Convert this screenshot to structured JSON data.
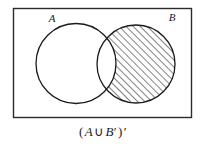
{
  "figure": {
    "universe": {
      "shape": "rectangle",
      "label": "",
      "stroke_color": "#2b2b2b"
    },
    "sets": [
      {
        "id": "A",
        "label": "A",
        "fill": "none",
        "shaded": false,
        "stroke_color": "#1a1a1a"
      },
      {
        "id": "B",
        "label": "B",
        "fill": "hatch",
        "shaded": true,
        "stroke_color": "#1a1a1a"
      }
    ],
    "shaded_region_description": "B minus A",
    "hatch": {
      "direction": "diagonal-up-right",
      "spacing_px": 5,
      "color": "#1a1a1a"
    },
    "caption": {
      "full": "(A ∪ B′)′",
      "open_paren": "(",
      "left_set": "A",
      "operator": "∪",
      "right_set": "B",
      "right_prime": "′",
      "close_paren": ")",
      "outer_prime": "′"
    }
  }
}
